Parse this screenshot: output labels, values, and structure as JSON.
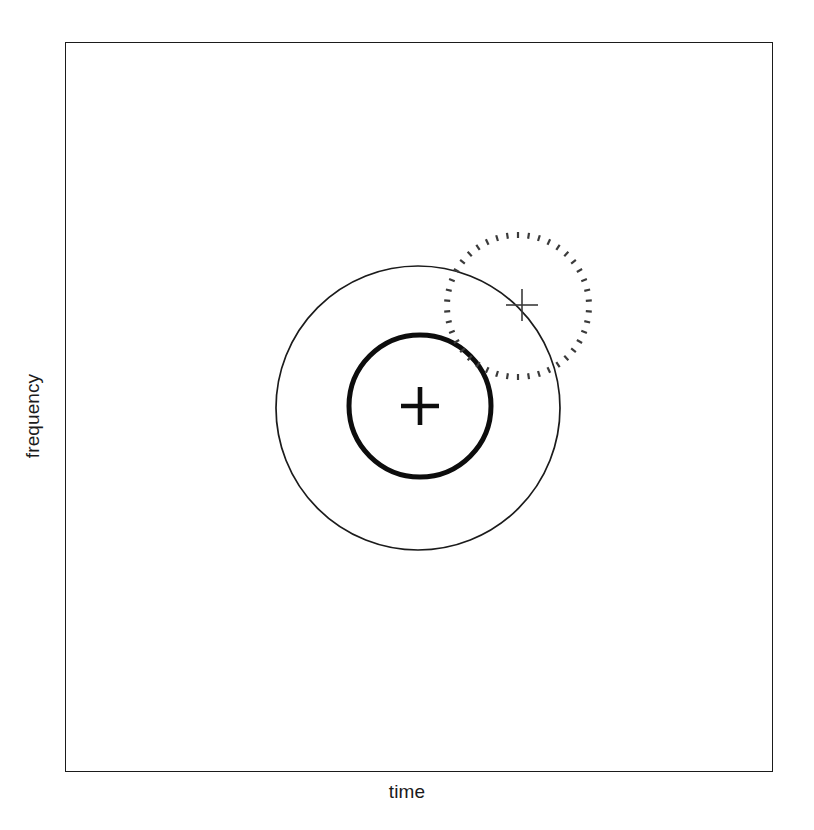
{
  "figure": {
    "background_color": "#ffffff",
    "width": 814,
    "height": 830
  },
  "axes": {
    "x_label": "time",
    "y_label": "frequency",
    "frame": {
      "x": 65,
      "y": 42,
      "width": 708,
      "height": 730,
      "stroke_color": "#1b1b1b",
      "stroke_width": 1.6,
      "ticks": [],
      "tick_labels": [],
      "grid": false
    }
  },
  "chart_data": {
    "type": "diagram",
    "title": "",
    "xlabel": "time",
    "ylabel": "frequency",
    "grid": false,
    "legend": null,
    "shapes": [
      {
        "name": "outer-thin-circle",
        "kind": "circle",
        "cx": 418,
        "cy": 408,
        "r": 142,
        "stroke": "#1b1b1b",
        "stroke_width": 1.7,
        "style": "solid",
        "fill": "none"
      },
      {
        "name": "inner-thick-circle",
        "kind": "circle",
        "cx": 420,
        "cy": 406,
        "r": 71,
        "stroke": "#0d0d0d",
        "stroke_width": 5,
        "style": "solid",
        "fill": "none"
      },
      {
        "name": "dotted-circle",
        "kind": "circle",
        "cx": 518,
        "cy": 306,
        "r": 71,
        "stroke": "#3a3a3a",
        "stroke_width": 2.2,
        "style": "dotted-radial",
        "fill": "none",
        "dash_count": 42,
        "dash_length": 6
      },
      {
        "name": "center-thick-cross",
        "kind": "cross",
        "cx": 420,
        "cy": 406,
        "arm": 19,
        "stroke": "#0d0d0d",
        "stroke_width": 4.6
      },
      {
        "name": "center-thin-cross",
        "kind": "cross",
        "cx": 522,
        "cy": 305,
        "arm": 16,
        "stroke": "#3a3a3a",
        "stroke_width": 1.6
      }
    ]
  },
  "colors": {
    "ink": "#1b1b1b",
    "bold_ink": "#0d0d0d",
    "muted_ink": "#3a3a3a",
    "background": "#ffffff"
  }
}
